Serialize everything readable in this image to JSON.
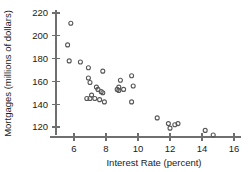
{
  "chart_data": {
    "type": "scatter",
    "title": "",
    "xlabel": "Interest Rate (percent)",
    "ylabel": "Mortgages (millions of dollars)",
    "xlim": [
      4.6,
      16.6
    ],
    "ylim": [
      108,
      226
    ],
    "xticks": [
      6,
      8,
      10,
      12,
      14,
      16
    ],
    "yticks": [
      120,
      140,
      160,
      180,
      200,
      220
    ],
    "xticklabels": [
      "6",
      "8",
      "10",
      "12",
      "14",
      "16"
    ],
    "yticklabels": [
      "120",
      "140",
      "160",
      "180",
      "200",
      "220"
    ],
    "grid": false,
    "legend": null,
    "marker": "open-circle",
    "marker_color": "#575757",
    "points": [
      {
        "x": 5.8,
        "y": 211
      },
      {
        "x": 5.6,
        "y": 192
      },
      {
        "x": 5.7,
        "y": 178
      },
      {
        "x": 6.4,
        "y": 177
      },
      {
        "x": 6.9,
        "y": 172
      },
      {
        "x": 7.8,
        "y": 169
      },
      {
        "x": 6.9,
        "y": 163
      },
      {
        "x": 7.0,
        "y": 159
      },
      {
        "x": 7.4,
        "y": 155
      },
      {
        "x": 7.5,
        "y": 153
      },
      {
        "x": 7.7,
        "y": 151
      },
      {
        "x": 7.8,
        "y": 150
      },
      {
        "x": 7.1,
        "y": 148
      },
      {
        "x": 6.8,
        "y": 145
      },
      {
        "x": 7.0,
        "y": 145
      },
      {
        "x": 7.3,
        "y": 145
      },
      {
        "x": 7.6,
        "y": 144
      },
      {
        "x": 7.9,
        "y": 142
      },
      {
        "x": 8.9,
        "y": 161
      },
      {
        "x": 8.8,
        "y": 155
      },
      {
        "x": 8.7,
        "y": 153
      },
      {
        "x": 8.8,
        "y": 152
      },
      {
        "x": 9.1,
        "y": 153
      },
      {
        "x": 9.6,
        "y": 165
      },
      {
        "x": 9.7,
        "y": 156
      },
      {
        "x": 9.6,
        "y": 142
      },
      {
        "x": 11.2,
        "y": 128
      },
      {
        "x": 11.9,
        "y": 123
      },
      {
        "x": 12.0,
        "y": 119
      },
      {
        "x": 12.3,
        "y": 122
      },
      {
        "x": 12.5,
        "y": 123
      },
      {
        "x": 14.2,
        "y": 117
      },
      {
        "x": 14.7,
        "y": 113
      }
    ]
  }
}
